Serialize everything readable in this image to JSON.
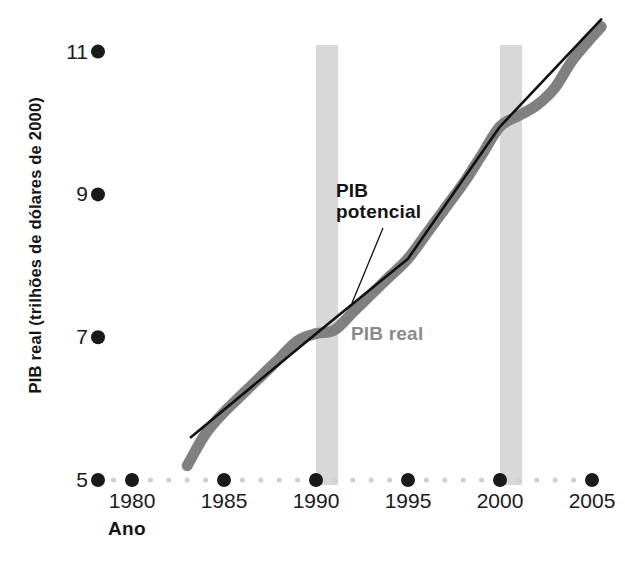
{
  "chart_data": {
    "type": "line",
    "title": "",
    "xlabel": "Ano",
    "ylabel": "PIB real (trilhões de dólares de 2000)",
    "xlim": [
      1977.8,
      2006.2
    ],
    "ylim": [
      5,
      11.6
    ],
    "grid": false,
    "legend_position": "inline-annotation",
    "xticks": [
      1980,
      1985,
      1990,
      1995,
      2000,
      2005
    ],
    "xtick_labels": [
      "1980",
      "1985",
      "1990",
      "1995",
      "2000",
      "2005"
    ],
    "xtick_minor_step": 1,
    "yticks": [
      5,
      7,
      9,
      11
    ],
    "ytick_labels": [
      "5",
      "9",
      "7",
      "11"
    ],
    "ytick_labels_ordered": [
      "11",
      "9",
      "7",
      "5"
    ],
    "series": [
      {
        "name": "PIB real",
        "color": "#808080",
        "style": "thick-line",
        "x": [
          1983.0,
          1984.0,
          1985.0,
          1986.0,
          1987.0,
          1988.0,
          1989.0,
          1990.0,
          1991.0,
          1992.0,
          1993.0,
          1994.0,
          1995.0,
          1996.0,
          1997.0,
          1998.0,
          1999.0,
          2000.0,
          2001.0,
          2002.0,
          2003.0,
          2004.0,
          2005.5
        ],
        "values": [
          5.2,
          5.65,
          5.95,
          6.2,
          6.45,
          6.7,
          6.95,
          7.05,
          7.1,
          7.35,
          7.6,
          7.85,
          8.1,
          8.45,
          8.8,
          9.15,
          9.55,
          9.95,
          10.1,
          10.25,
          10.5,
          10.9,
          11.35
        ]
      },
      {
        "name": "PIB potencial",
        "color": "#111111",
        "style": "thin-line",
        "x": [
          1983.2,
          1990.0,
          1995.0,
          2000.0,
          2005.5
        ],
        "values": [
          5.6,
          7.05,
          8.1,
          9.95,
          11.45
        ]
      }
    ],
    "shaded_bands": [
      {
        "name": "recessao-1990",
        "x_start": 1990.0,
        "x_end": 1991.2,
        "color": "#d8d8d8"
      },
      {
        "name": "recessao-2001",
        "x_start": 2000.0,
        "x_end": 2001.2,
        "color": "#d8d8d8"
      }
    ],
    "annotations": [
      {
        "name": "PIB potencial",
        "text_line1": "PIB",
        "text_line2": "potencial",
        "color": "#141414",
        "leader_line": true
      },
      {
        "name": "PIB real",
        "text_line1": "PIB real",
        "color": "#8a8a8a",
        "leader_line": false
      }
    ]
  },
  "axis": {
    "y_title": "PIB real (trilhões de dólares de 2000)",
    "x_title": "Ano",
    "y_ticks": [
      {
        "label": "11"
      },
      {
        "label": "9"
      },
      {
        "label": "7"
      },
      {
        "label": "5"
      }
    ],
    "x_ticks": [
      {
        "label": "1980"
      },
      {
        "label": "1985"
      },
      {
        "label": "1990"
      },
      {
        "label": "1995"
      },
      {
        "label": "2000"
      },
      {
        "label": "2005"
      }
    ]
  },
  "annotations": {
    "potential_line1": "PIB",
    "potential_line2": "potencial",
    "real": "PIB real"
  },
  "colors": {
    "real_series": "#808080",
    "potential_series": "#111111",
    "band": "#d8d8d8",
    "tick_major": "#1a1a1a",
    "tick_minor": "#d0d0d0",
    "text": "#151515",
    "real_label": "#8a8a8a"
  }
}
